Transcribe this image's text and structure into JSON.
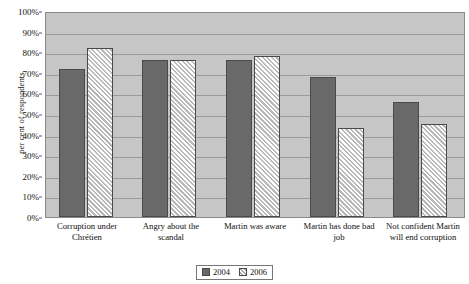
{
  "chart_data": {
    "type": "bar",
    "title": "",
    "xlabel": "",
    "ylabel": "per cent of respondents",
    "ylim": [
      0,
      100
    ],
    "grid": true,
    "legend_position": "bottom-center",
    "categories": [
      "Corruption under Chrétien",
      "Angry about the scandal",
      "Martin was aware",
      "Martin has done bad job",
      "Not confident Martin will end corruption"
    ],
    "y_tick_labels": [
      "0%",
      "10%",
      "20%",
      "30%",
      "40%",
      "50%",
      "60%",
      "70%",
      "80%",
      "90%",
      "100%"
    ],
    "y_tick_values": [
      0,
      10,
      20,
      30,
      40,
      50,
      60,
      70,
      80,
      90,
      100
    ],
    "series": [
      {
        "name": "2004",
        "color": "#696969",
        "values": [
          72,
          76,
          76,
          68,
          56
        ]
      },
      {
        "name": "2006",
        "color": "#b9b9b9",
        "values": [
          82,
          76,
          78,
          43,
          45
        ]
      }
    ]
  },
  "legend": {
    "items": [
      {
        "label": "2004",
        "swatch": "solid-dark-square-swatch"
      },
      {
        "label": "2006",
        "swatch": "hatched-square-swatch"
      }
    ]
  },
  "colors": {
    "plot_background": "#c6c6c6",
    "gridline": "#9a9a9a",
    "series_2004": "#696969",
    "series_2006": "#b9b9b9",
    "bar_border": "#4a4a4a"
  }
}
